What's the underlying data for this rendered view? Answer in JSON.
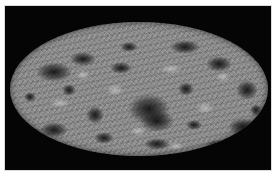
{
  "figure": {
    "caption_partial": "",
    "colors": {
      "frame_background": "#050505",
      "page_background": "#ffffff",
      "map_mid_gray": "#8c8c8c",
      "cold_spot": "#0f0f0f"
    }
  },
  "blobs": [
    {
      "x": 118,
      "y": 72,
      "w": 42,
      "h": 30
    },
    {
      "x": 130,
      "y": 88,
      "w": 34,
      "h": 22
    },
    {
      "x": 26,
      "y": 40,
      "w": 36,
      "h": 20
    },
    {
      "x": 60,
      "y": 30,
      "w": 26,
      "h": 14
    },
    {
      "x": 160,
      "y": 18,
      "w": 30,
      "h": 14
    },
    {
      "x": 196,
      "y": 34,
      "w": 26,
      "h": 16
    },
    {
      "x": 226,
      "y": 58,
      "w": 22,
      "h": 20
    },
    {
      "x": 218,
      "y": 96,
      "w": 30,
      "h": 18
    },
    {
      "x": 196,
      "y": 118,
      "w": 24,
      "h": 10
    },
    {
      "x": 30,
      "y": 100,
      "w": 28,
      "h": 16
    },
    {
      "x": 76,
      "y": 84,
      "w": 18,
      "h": 18
    },
    {
      "x": 84,
      "y": 110,
      "w": 20,
      "h": 12
    },
    {
      "x": 134,
      "y": 116,
      "w": 26,
      "h": 12
    },
    {
      "x": 100,
      "y": 40,
      "w": 22,
      "h": 12
    },
    {
      "x": 168,
      "y": 60,
      "w": 16,
      "h": 14
    },
    {
      "x": 52,
      "y": 62,
      "w": 14,
      "h": 12
    },
    {
      "x": 176,
      "y": 98,
      "w": 16,
      "h": 10
    },
    {
      "x": 110,
      "y": 20,
      "w": 18,
      "h": 10
    },
    {
      "x": 240,
      "y": 82,
      "w": 12,
      "h": 12
    },
    {
      "x": 14,
      "y": 70,
      "w": 12,
      "h": 10
    }
  ],
  "specks": [
    {
      "x": 40,
      "y": 76,
      "w": 20,
      "h": 10
    },
    {
      "x": 96,
      "y": 62,
      "w": 18,
      "h": 12
    },
    {
      "x": 150,
      "y": 42,
      "w": 22,
      "h": 10
    },
    {
      "x": 186,
      "y": 80,
      "w": 18,
      "h": 12
    },
    {
      "x": 120,
      "y": 104,
      "w": 16,
      "h": 10
    },
    {
      "x": 66,
      "y": 48,
      "w": 14,
      "h": 10
    },
    {
      "x": 206,
      "y": 50,
      "w": 14,
      "h": 10
    },
    {
      "x": 158,
      "y": 120,
      "w": 16,
      "h": 8
    }
  ]
}
